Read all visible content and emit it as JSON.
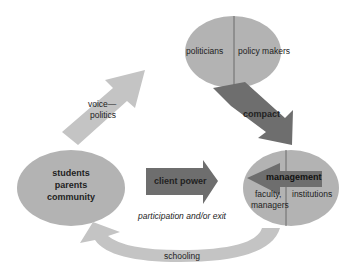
{
  "nodes": {
    "top": {
      "left": "politicians",
      "right": "policy makers"
    },
    "left": {
      "lines": [
        "students",
        "parents",
        "community"
      ]
    },
    "right": {
      "title": "management",
      "left": "faculty,",
      "left2": "managers",
      "right": "institutions"
    }
  },
  "arrows": {
    "voice": {
      "line1": "voice—",
      "line2": "politics"
    },
    "compact": "compact",
    "client_power": "client power",
    "participation": "participation and/or exit",
    "schooling": "schooling"
  },
  "colors": {
    "ellipse": "#b3b3b3",
    "light_arrow": "#c4c4c4",
    "dark_arrow": "#6e6e6e",
    "divider": "#6a6a6a"
  }
}
